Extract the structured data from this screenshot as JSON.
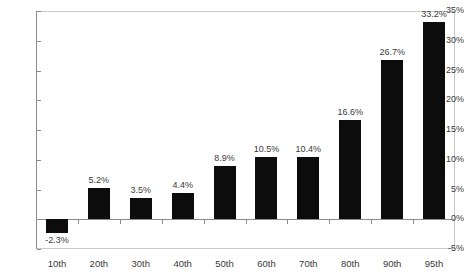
{
  "chart_data": {
    "type": "bar",
    "title": "",
    "subtitle": "",
    "xlabel": "",
    "ylabel": "",
    "categories": [
      "10th",
      "20th",
      "30th",
      "40th",
      "50th",
      "60th",
      "70th",
      "80th",
      "90th",
      "95th"
    ],
    "values": [
      -2.3,
      5.2,
      3.5,
      4.4,
      8.9,
      10.5,
      10.4,
      16.6,
      26.7,
      33.2
    ],
    "data_labels": [
      "-2.3%",
      "5.2%",
      "3.5%",
      "4.4%",
      "8.9%",
      "10.5%",
      "10.4%",
      "16.6%",
      "26.7%",
      "33.2%"
    ],
    "ylim": [
      -5,
      35
    ],
    "ytick_step": 5,
    "ytick_labels": [
      "35%",
      "30%",
      "25%",
      "20%",
      "15%",
      "10%",
      "5%",
      "0%",
      "-5%"
    ],
    "ytick_values": [
      35,
      30,
      25,
      20,
      15,
      10,
      5,
      0,
      -5
    ],
    "grid": false,
    "legend": false,
    "legend_position": "none",
    "series": [
      {
        "name": "",
        "values": [
          -2.3,
          5.2,
          3.5,
          4.4,
          8.9,
          10.5,
          10.4,
          16.6,
          26.7,
          33.2
        ]
      }
    ],
    "bar_color": "#0c0c0c",
    "axis_color": "#8c8c8c",
    "frame_color": "#c9c9c9",
    "background_color": "#ffffff",
    "text_color": "#3a3a3a"
  }
}
